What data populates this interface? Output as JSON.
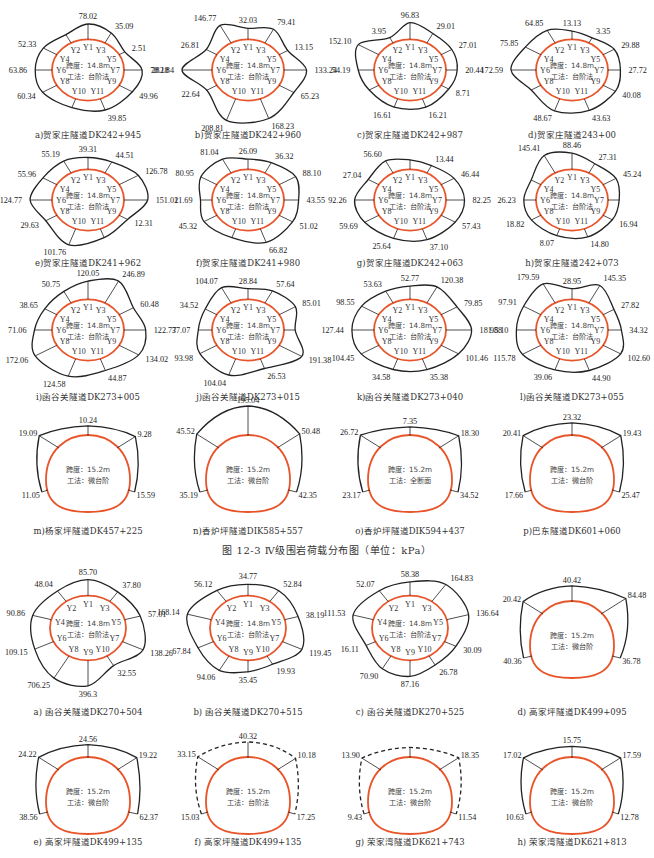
{
  "figure_caption": "图 12-3   Ⅳ级围岩荷载分布图（单位：kPa）",
  "colors": {
    "reference_outline": "#e8552a",
    "load_outline": "#222222",
    "text": "#222222"
  },
  "info_labels": {
    "span_148": "跨度：14.8m",
    "span_152": "跨度：15.2m",
    "method_bench": "工法：台阶法",
    "method_micro": "工法：微台阶",
    "method_full": "工法：全断面"
  },
  "panels_top": [
    {
      "id": "a",
      "caption": "a)贺家庄隧道DK242+945",
      "values": {
        "top_left": "215.58",
        "Y1": "78.02",
        "Y3": "35.09",
        "Y5": "2.51",
        "Y4": "52.33",
        "Y6": "63.86",
        "Y7": "78.18",
        "Y8": "60.34",
        "Y9": "49.96",
        "Y11": "39.85"
      }
    },
    {
      "id": "b",
      "caption": "b)贺家庄隧道DK242+960",
      "values": {
        "Y2": "146.77",
        "Y1": "32.03",
        "Y3": "79.41",
        "Y4": "26.81",
        "Y5": "13.15",
        "Y6": "282.84",
        "Y7": "133.24",
        "Y8": "22.64",
        "Y9": "65.23",
        "Y10": "208.81",
        "Y11": "168.23"
      }
    },
    {
      "id": "c",
      "caption": "c)贺家庄隧道DK242+987",
      "values": {
        "Y4": "152.10",
        "Y2": "3.95",
        "Y1": "96.83",
        "Y3": "29.01",
        "Y5": "27.01",
        "Y6": "54.19",
        "Y7": "20.44",
        "Y9": "8.71",
        "Y10": "16.61",
        "Y11": "16.21"
      }
    },
    {
      "id": "d",
      "caption": "d)贺家庄隧道243+00",
      "values": {
        "Y2": "64.85",
        "Y1": "13.13",
        "Y3": "3.35",
        "Y4": "75.85",
        "Y5": "29.88",
        "Y6": "172.59",
        "Y7": "27.72",
        "Y9": "40.08",
        "Y10": "48.67",
        "Y11": "43.63"
      }
    },
    {
      "id": "e",
      "caption": "e)贺家庄隧道DK241+962",
      "values": {
        "Y2": "55.19",
        "Y1": "39.31",
        "Y3": "44.51",
        "Y5": "126.78",
        "Y4": "55.96",
        "Y6": "124.77",
        "Y7": "151.01",
        "Y8": "29.63",
        "Y9": "12.31",
        "Y10": "101.76"
      }
    },
    {
      "id": "f",
      "caption": "f)贺家庄隧道DK241+980",
      "values": {
        "Y2": "81.04",
        "Y1": "26.09",
        "Y3": "36.32",
        "Y5": "88.10",
        "Y4": "80.95",
        "Y6": "21.69",
        "Y7": "43.55",
        "Y8": "45.32",
        "Y9": "51.02",
        "Y11": "66.82"
      }
    },
    {
      "id": "g",
      "caption": "g)贺家庄隧道DK242+063",
      "values": {
        "Y2": "56.60",
        "Y3": "13.44",
        "Y5": "46.44",
        "Y4": "27.04",
        "Y6": "92.26",
        "Y7": "82.25",
        "Y8": "59.69",
        "Y9": "57.43",
        "Y10": "25.64",
        "Y11": "37.10"
      }
    },
    {
      "id": "h",
      "caption": "h)贺家庄隧道242+073",
      "values": {
        "Y2": "145.41",
        "Y1": "88.46",
        "Y3": "27.31",
        "Y5": "45.24",
        "Y6": "26.23",
        "Y8": "18.82",
        "Y9": "16.94",
        "Y10": "8.07",
        "Y11": "14.80"
      }
    },
    {
      "id": "i",
      "caption": "i)函谷关隧道DK273+005",
      "values": {
        "Y1": "120.05",
        "Y3": "246.89",
        "Y2": "50.75",
        "Y4": "38.65",
        "Y5": "60.48",
        "Y6": "71.06",
        "Y7": "122.77",
        "Y8": "172.06",
        "Y9": "134.02",
        "Y10": "124.58",
        "Y11": "44.87"
      }
    },
    {
      "id": "j",
      "caption": "j)函谷关隧道DK273+015",
      "values": {
        "Y2": "104.07",
        "Y1": "28.84",
        "Y3": "57.64",
        "Y5": "85.01",
        "Y4": "34.52",
        "Y6": "37.07",
        "Y8": "93.98",
        "Y9": "191.38",
        "Y10": "104.04",
        "Y11": "26.53"
      }
    },
    {
      "id": "k",
      "caption": "k)函谷关隧道DK273+040",
      "values": {
        "Y2": "53.63",
        "Y1": "52.77",
        "Y3": "120.38",
        "Y4": "98.55",
        "Y5": "79.85",
        "Y6": "127.44",
        "Y7": "181.88",
        "Y8": "104.45",
        "Y9": "101.46",
        "Y10": "34.58",
        "Y11": "35.38"
      }
    },
    {
      "id": "l",
      "caption": "l)函谷关隧道DK273+055",
      "values": {
        "Y2": "179.59",
        "Y1": "28.95",
        "Y3": "145.35",
        "Y4": "97.91",
        "Y5": "27.82",
        "Y6": "95.10",
        "Y7": "34.32",
        "Y8": "115.78",
        "Y9": "102.60",
        "Y10": "39.06",
        "Y11": "44.90"
      }
    },
    {
      "id": "m",
      "caption": "m)杨家坪隧道DK457+225",
      "span": "15.2",
      "method": "微台阶",
      "values": {
        "crown": "10.24",
        "left_shoulder": "19.09",
        "right_shoulder": "9.28",
        "left_wall": "11.05",
        "right_wall": "15.59"
      }
    },
    {
      "id": "n",
      "caption": "n)香炉坪隧道DIK585+557",
      "span": "15.2",
      "method": "微台阶",
      "values": {
        "crown": "195.04",
        "left_shoulder": "45.52",
        "right_shoulder": "50.48",
        "left_wall": "35.19",
        "right_wall": "42.35"
      }
    },
    {
      "id": "o",
      "caption": "o)香炉坪隧道DIK594+437",
      "span": "15.2",
      "method": "全断面",
      "values": {
        "crown": "7.35",
        "left_shoulder": "26.72",
        "right_shoulder": "18.30",
        "left_wall": "23.17",
        "right_wall": "34.52"
      }
    },
    {
      "id": "p",
      "caption": "p)巴东隧道DK601+060",
      "span": "15.2",
      "method": "微台阶",
      "values": {
        "crown": "23.32",
        "left_shoulder": "20.41",
        "right_shoulder": "19.43",
        "left_wall": "17.66",
        "right_wall": "25.47"
      }
    }
  ],
  "panels_bottom": [
    {
      "id": "a2",
      "caption": "a) 函谷关隧道DK270+504",
      "values": {
        "Y1": "85.70",
        "Y2": "48.04",
        "Y3": "37.80",
        "Y4": "90.86",
        "Y5": "57.01",
        "Y6": "109.15",
        "Y7": "138.26",
        "Y8": "706.25",
        "Y9": "396.3",
        "Y10": "32.55"
      }
    },
    {
      "id": "b2",
      "caption": "b) 函谷关隧道DK270+515",
      "values": {
        "Y1": "34.77",
        "Y2": "56.12",
        "Y3": "52.84",
        "Y4": "168.14",
        "Y5": "38.19",
        "Y6": "67.84",
        "Y7": "119.45",
        "Y8": "94.06",
        "Y9": "35.45",
        "Y10": "19.93"
      }
    },
    {
      "id": "c2",
      "caption": "c) 函谷关隧道DK270+525",
      "values": {
        "Y1": "58.38",
        "Y2": "52.07",
        "Y3": "164.83",
        "Y4": "111.53",
        "Y5": "136.64",
        "Y6": "16.11",
        "Y7": "30.09",
        "Y8": "70.90",
        "Y9": "87.16",
        "Y10": "26.78"
      }
    },
    {
      "id": "d2",
      "caption": "d) 高家坪隧道DK499+095",
      "span": "15.2",
      "method": "微台阶",
      "values": {
        "crown": "40.42",
        "left_shoulder": "20.42",
        "right_shoulder": "84.48",
        "left_wall": "40.36",
        "right_wall": "36.78"
      }
    },
    {
      "id": "e2",
      "caption": "e) 高家坪隧道DK499+135",
      "span": "15.2",
      "method": "微台阶",
      "values": {
        "crown": "24.56",
        "left_shoulder": "24.22",
        "right_shoulder": "19.22",
        "left_wall": "38.56",
        "right_wall": "62.37"
      }
    },
    {
      "id": "f2",
      "caption": "f) 高家坪隧道DK499+135",
      "span": "15.2",
      "method": "台阶法",
      "values": {
        "crown": "40.32",
        "left_shoulder": "33.15",
        "right_shoulder": "10.18",
        "left_wall": "15.03",
        "right_wall": "17.25"
      }
    },
    {
      "id": "g2",
      "caption": "g) 荣家湾隧道DK621+743",
      "span": "15.2",
      "method": "微台阶",
      "values": {
        "left_shoulder": "13.90",
        "right_shoulder": "18.35",
        "left_wall": "9.43",
        "right_wall": "11.54"
      }
    },
    {
      "id": "h2",
      "caption": "h) 荣家湾隧道DK621+813",
      "span": "15.2",
      "method": "微台阶",
      "values": {
        "crown": "15.75",
        "left_shoulder": "17.02",
        "right_shoulder": "17.59",
        "left_wall": "10.63",
        "right_wall": "12.78"
      }
    }
  ]
}
